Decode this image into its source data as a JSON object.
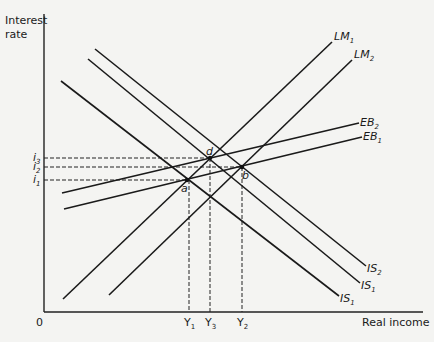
{
  "chart_data": {
    "type": "diagram",
    "title": "",
    "ylabel": "Interest rate",
    "xlabel": "Real income",
    "origin_label": "0",
    "y_ticks": [
      {
        "label": "i",
        "sub": "3",
        "y": 158
      },
      {
        "label": "i",
        "sub": "2",
        "y": 167
      },
      {
        "label": "i",
        "sub": "1",
        "y": 180
      }
    ],
    "x_ticks": [
      {
        "label": "Y",
        "sub": "1",
        "x": 189
      },
      {
        "label": "Y",
        "sub": "3",
        "x": 210
      },
      {
        "label": "Y",
        "sub": "2",
        "x": 242
      }
    ],
    "curves": [
      {
        "name": "LM1",
        "label": "LM",
        "sub": "1",
        "x1": 63,
        "y1": 299,
        "x2": 332,
        "y2": 42
      },
      {
        "name": "LM2",
        "label": "LM",
        "sub": "2",
        "x1": 109,
        "y1": 295,
        "x2": 352,
        "y2": 60
      },
      {
        "name": "EB2",
        "label": "EB",
        "sub": "2",
        "x1": 62,
        "y1": 193,
        "x2": 359,
        "y2": 123
      },
      {
        "name": "EB1",
        "label": "EB",
        "sub": "1",
        "x1": 64,
        "y1": 209,
        "x2": 362,
        "y2": 137
      },
      {
        "name": "IS2",
        "label": "IS",
        "sub": "2",
        "x1": 95,
        "y1": 49,
        "x2": 366,
        "y2": 266
      },
      {
        "name": "IS1-upper",
        "label": "IS",
        "sub": "1",
        "x1": 88,
        "y1": 59,
        "x2": 360,
        "y2": 283
      },
      {
        "name": "IS1-lower",
        "label": "IS",
        "sub": "1",
        "x1": 61,
        "y1": 81,
        "x2": 339,
        "y2": 296
      }
    ],
    "points": [
      {
        "label": "a",
        "x": 187,
        "y": 180
      },
      {
        "label": "d",
        "x": 210,
        "y": 158
      },
      {
        "label": "b",
        "x": 242,
        "y": 167
      }
    ],
    "grid": false,
    "legend": "none"
  }
}
